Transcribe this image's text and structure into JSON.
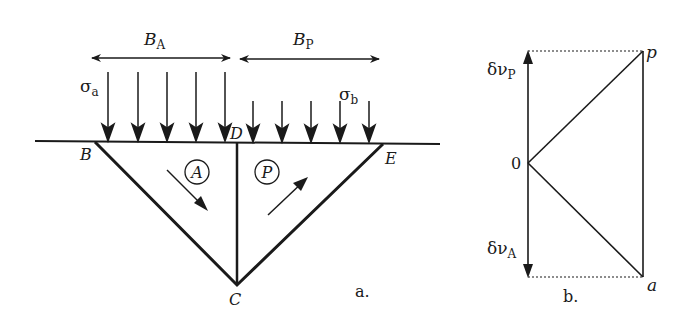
{
  "figure_a": {
    "caption": "a.",
    "width_labels": {
      "active": "B",
      "active_sub": "A",
      "passive": "B",
      "passive_sub": "P"
    },
    "stress_labels": {
      "active": "σ",
      "active_sub": "a",
      "passive": "σ",
      "passive_sub": "b"
    },
    "points": {
      "B": "B",
      "C": "C",
      "D": "D",
      "E": "E"
    },
    "zones": {
      "active": "A",
      "passive": "P"
    },
    "active_load_arrows": 5,
    "passive_load_arrows": 5
  },
  "figure_b": {
    "caption": "b.",
    "origin_label": "0",
    "point_p": "p",
    "point_a": "a",
    "dv_p": {
      "main": "δν",
      "sub": "P"
    },
    "dv_a": {
      "main": "δν",
      "sub": "A"
    }
  },
  "colors": {
    "ink": "#1a1a1a",
    "background": "#ffffff"
  }
}
